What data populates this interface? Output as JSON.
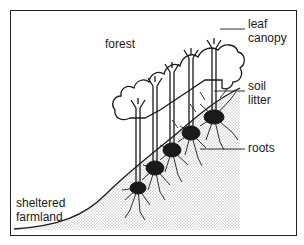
{
  "diagram": {
    "type": "illustration",
    "labels": {
      "forest": "forest",
      "leaf_canopy_line1": "leaf",
      "leaf_canopy_line2": "canopy",
      "soil_litter_line1": "soil",
      "soil_litter_line2": "litter",
      "roots": "roots",
      "farmland_line1": "sheltered",
      "farmland_line2": "farmland"
    },
    "tree_count": 5,
    "colors": {
      "ink": "#1a1a1a",
      "stipple": "#bdbdbd",
      "background": "#ffffff"
    }
  }
}
